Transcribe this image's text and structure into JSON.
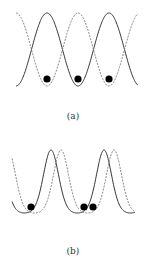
{
  "figure": {
    "panels": [
      {
        "id": "a",
        "label": "(a)",
        "description": "Two counter-phase sinusoidal potentials (solid and dashed) with particles in the dashed-curve minima",
        "solid_phase_deg": 0,
        "dashed_phase_deg": 180,
        "particles": 3
      },
      {
        "id": "b",
        "label": "(b)",
        "description": "Two slightly shifted tilted/asymmetric potentials (solid and dashed) with particles near the minima",
        "solid_phase_deg": 0,
        "dashed_phase_deg": 30,
        "particles": 3
      }
    ],
    "colors": {
      "solid_line": "#333333",
      "dashed_line": "#777777",
      "particle": "#000000"
    }
  }
}
